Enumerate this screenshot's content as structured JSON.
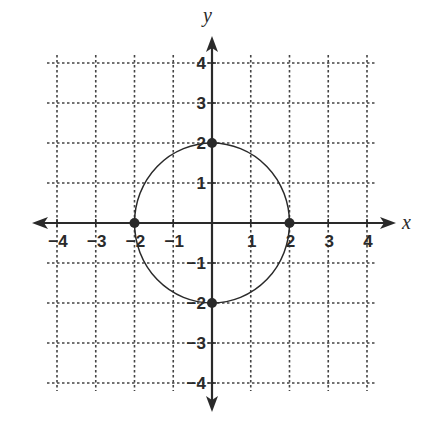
{
  "chart_data": {
    "type": "scatter",
    "title": "",
    "xlabel": "x",
    "ylabel": "y",
    "xlim": [
      -4,
      4
    ],
    "ylim": [
      -4,
      4
    ],
    "grid": true,
    "grid_style": "dotted",
    "x_ticks": [
      -4,
      -3,
      -2,
      -1,
      1,
      2,
      3,
      4
    ],
    "y_ticks": [
      4,
      3,
      2,
      1,
      -1,
      -2,
      -3,
      -4
    ],
    "x_tick_labels": [
      "−4",
      "−3",
      "−2",
      "−1",
      "1",
      "2",
      "3",
      "4"
    ],
    "y_tick_labels": [
      "4",
      "3",
      "2",
      "1",
      "−1",
      "−2",
      "−3",
      "−4"
    ],
    "curves": [
      {
        "name": "circle",
        "shape": "circle",
        "center": [
          0,
          0
        ],
        "radius": 2,
        "equation": "x^2 + y^2 = 4"
      }
    ],
    "points": [
      {
        "x": 0,
        "y": 2
      },
      {
        "x": 2,
        "y": 0
      },
      {
        "x": 0,
        "y": -2
      },
      {
        "x": -2,
        "y": 0
      }
    ]
  },
  "colors": {
    "ink": "#2a2a2a",
    "grid": "#444444",
    "background": "#ffffff"
  }
}
